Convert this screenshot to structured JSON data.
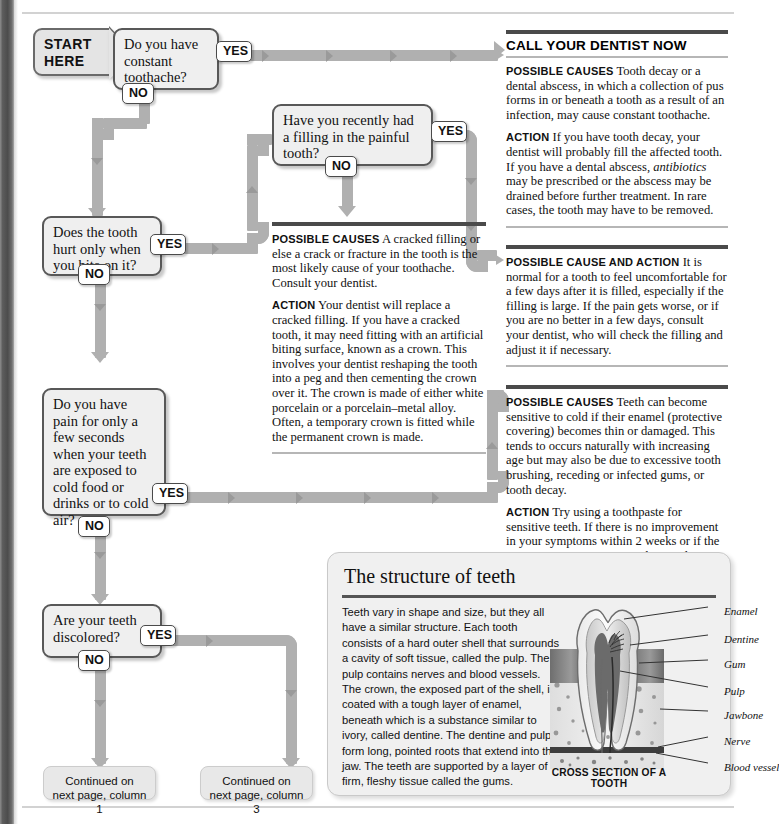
{
  "flow": {
    "start": {
      "line1": "START",
      "line2": "HERE"
    },
    "questions": [
      {
        "id": "q-constant-toothache",
        "text": "Do you have constant toothache?",
        "yes": "YES",
        "no": "NO"
      },
      {
        "id": "q-recent-filling",
        "text": "Have you recently had a filling in the painful tooth?",
        "yes": "YES",
        "no": "NO"
      },
      {
        "id": "q-bite-pain",
        "text": "Does the tooth hurt only when you bite on it?",
        "yes": "YES",
        "no": "NO"
      },
      {
        "id": "q-cold-sensitivity",
        "text": "Do you have pain for only a few seconds when your teeth are exposed to cold food or drinks or to cold air?",
        "yes": "YES",
        "no": "NO"
      },
      {
        "id": "q-discolored",
        "text": "Are your teeth discolored?",
        "yes": "YES",
        "no": "NO"
      }
    ],
    "continuations": [
      {
        "id": "cont-col1",
        "line1": "Continued on",
        "line2": "next page, column 1"
      },
      {
        "id": "cont-col3",
        "line1": "Continued on",
        "line2": "next page, column 3"
      }
    ]
  },
  "advice": {
    "call_dentist": {
      "title": "CALL YOUR DENTIST NOW",
      "causes_label": "POSSIBLE CAUSES",
      "causes_text": "Tooth decay or a dental abscess, in which a collection of pus forms in or beneath a tooth as a result of an infection, may cause constant toothache.",
      "action_label": "ACTION",
      "action_text_1": "If you have tooth decay, your dentist will probably fill the affected tooth. If you have a dental abscess, ",
      "action_italic": "antibiotics",
      "action_text_2": " may be prescribed or the abscess may be drained before further treatment. In rare cases, the tooth may have to be removed."
    },
    "cracked_filling": {
      "causes_label": "POSSIBLE CAUSES",
      "causes_text": "A cracked filling or else a crack or fracture in the tooth is the most likely cause of your toothache. Consult your dentist.",
      "action_label": "ACTION",
      "action_text": "Your dentist will replace a cracked filling. If you have a cracked tooth, it may need fitting with an artificial biting surface, known as a crown. This involves your dentist reshaping the tooth into a peg and then cementing the crown over it. The crown is made of either white porcelain or a porcelain–metal alloy. Often, a temporary crown is fitted while the permanent crown is made."
    },
    "after_filling": {
      "label": "POSSIBLE CAUSE AND ACTION",
      "text": "It is normal for a tooth to feel uncomfortable for a few days after it is filled, especially if the filling is large. If the pain gets worse, or if you are no better in a few days, consult your dentist, who will check the filling and adjust it if necessary."
    },
    "sensitive_teeth": {
      "causes_label": "POSSIBLE CAUSES",
      "causes_text": "Teeth can become sensitive to cold if their enamel (protective covering) becomes thin or damaged. This tends to occurs naturally with increasing age but may also be due to excessive tooth brushing, receding or infected gums, or tooth decay.",
      "action_label": "ACTION",
      "action_text": "Try using a toothpaste for sensitive teeth. If there is no improvement in your symptoms within 2 weeks or if the symptoms get worse, consult your dentist."
    }
  },
  "structure_panel": {
    "title": "The structure of teeth",
    "body": "Teeth vary in shape and size, but they all have a similar structure. Each tooth consists of a hard outer shell that surrounds a cavity of soft tissue, called the pulp. The pulp contains nerves and blood vessels. The crown, the exposed part of the shell, is coated with a tough layer of enamel, beneath which is a substance similar to ivory, called dentine. The dentine and pulp form long, pointed roots that extend into the jaw. The teeth are supported by a layer of firm, fleshy tissue called the gums.",
    "figure_caption": "CROSS SECTION OF A TOOTH",
    "figure_labels": [
      "Enamel",
      "Dentine",
      "Gum",
      "Pulp",
      "Jawbone",
      "Nerve",
      "Blood vessel"
    ]
  },
  "colors": {
    "connector": "#b0b0b0",
    "box_fill": "#efefef",
    "box_border": "#585858",
    "rule_dark": "#4a4a4a",
    "rule_light": "#b6b6b6",
    "binding": "#4c4c4c"
  }
}
